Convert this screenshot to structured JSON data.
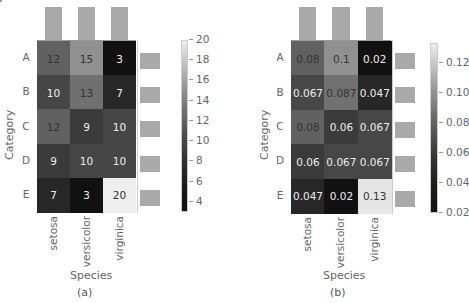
{
  "chart_data": [
    {
      "type": "heatmap",
      "caption": "(a)",
      "xlabel": "Species",
      "ylabel": "Category",
      "x_categories": [
        "setosa",
        "versicolor",
        "virginica"
      ],
      "y_categories": [
        "A",
        "B",
        "C",
        "D",
        "E"
      ],
      "values": [
        [
          12,
          15,
          3
        ],
        [
          10,
          13,
          7
        ],
        [
          12,
          9,
          10
        ],
        [
          9,
          10,
          10
        ],
        [
          7,
          3,
          20
        ]
      ],
      "labels": [
        [
          "12",
          "15",
          "3"
        ],
        [
          "10",
          "13",
          "7"
        ],
        [
          "12",
          "9",
          "10"
        ],
        [
          "9",
          "10",
          "10"
        ],
        [
          "7",
          "3",
          "20"
        ]
      ],
      "colormap": "gray",
      "colorbar": {
        "range": [
          3,
          20
        ],
        "ticks": [
          "20",
          "18",
          "16",
          "14",
          "12",
          "10",
          "8",
          "6",
          "4"
        ],
        "tick_values": [
          20,
          18,
          16,
          14,
          12,
          10,
          8,
          6,
          4
        ]
      },
      "marginal_top_bars": [
        1,
        1,
        1
      ],
      "marginal_right_bars": [
        1,
        1,
        1,
        1,
        1
      ]
    },
    {
      "type": "heatmap",
      "caption": "(b)",
      "xlabel": "Species",
      "ylabel": "Category",
      "x_categories": [
        "setosa",
        "versicolor",
        "virginica"
      ],
      "y_categories": [
        "A",
        "B",
        "C",
        "D",
        "E"
      ],
      "values": [
        [
          0.08,
          0.1,
          0.02
        ],
        [
          0.067,
          0.087,
          0.047
        ],
        [
          0.08,
          0.06,
          0.067
        ],
        [
          0.06,
          0.067,
          0.067
        ],
        [
          0.047,
          0.02,
          0.13
        ]
      ],
      "labels": [
        [
          "0.08",
          "0.1",
          "0.02"
        ],
        [
          "0.067",
          "0.087",
          "0.047"
        ],
        [
          "0.08",
          "0.06",
          "0.067"
        ],
        [
          "0.06",
          "0.067",
          "0.067"
        ],
        [
          "0.047",
          "0.02",
          "0.13"
        ]
      ],
      "colormap": "gray",
      "colorbar": {
        "range": [
          0.02,
          0.133
        ],
        "ticks": [
          "0.12",
          "0.10",
          "0.08",
          "0.06",
          "0.04",
          "0.02"
        ],
        "tick_values": [
          0.12,
          0.1,
          0.08,
          0.06,
          0.04,
          0.02
        ]
      },
      "marginal_top_bars": [
        1,
        1,
        1
      ],
      "marginal_right_bars": [
        1,
        1,
        1,
        1,
        1
      ]
    }
  ]
}
